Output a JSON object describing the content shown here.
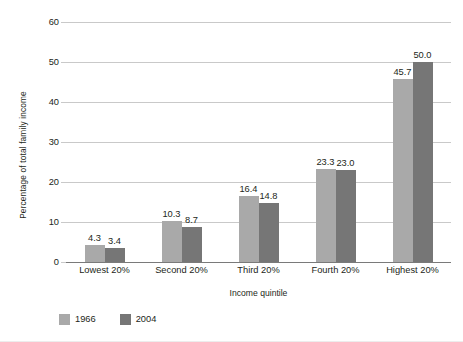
{
  "chart_data": {
    "type": "bar",
    "title": "",
    "subtitle": "",
    "xlabel": "Income quintile",
    "ylabel": "Percentage of total family income",
    "categories": [
      "Lowest 20%",
      "Second 20%",
      "Third 20%",
      "Fourth 20%",
      "Highest 20%"
    ],
    "series": [
      {
        "name": "1966",
        "color": "#a9a9a9",
        "values": [
          4.3,
          10.3,
          16.4,
          23.3,
          45.7
        ],
        "labels": [
          "4.3",
          "10.3",
          "16.4",
          "23.3",
          "45.7"
        ]
      },
      {
        "name": "2004",
        "color": "#767676",
        "values": [
          3.4,
          8.7,
          14.8,
          23.0,
          50.0
        ],
        "labels": [
          "3.4",
          "8.7",
          "14.8",
          "23.0",
          "50.0"
        ]
      }
    ],
    "ylim": [
      0,
      60
    ],
    "yticks": [
      0,
      10,
      20,
      30,
      40,
      50,
      60
    ],
    "ytick_labels": [
      "0",
      "10",
      "20",
      "30",
      "40",
      "50",
      "60"
    ],
    "grid": "horizontal",
    "legend_position": "below-left",
    "axis_line_color": "#7a7a7a",
    "gridline_color": "#c9c9c9",
    "background": "#ffffff",
    "data_labels": true
  },
  "legend": {
    "items": [
      {
        "label": "1966",
        "color": "#a9a9a9"
      },
      {
        "label": "2004",
        "color": "#767676"
      }
    ]
  }
}
